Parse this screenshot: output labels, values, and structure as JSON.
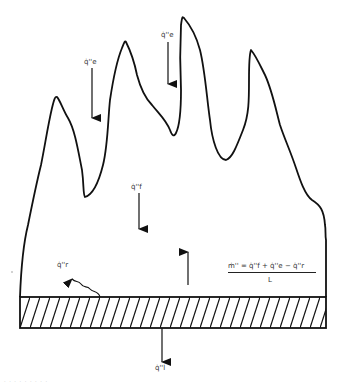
{
  "diagram": {
    "type": "flame heat flux schematic",
    "labels": {
      "external_flux_left": "q̇''e",
      "external_flux_top": "q̇''e",
      "flame_flux": "q̇''f",
      "reradiation_flux": "q̇''r",
      "loss_flux": "q̇''l"
    },
    "equation": {
      "numerator": "ṁ'' = q̇''f + q̇''e − q̇''r",
      "denominator": "L"
    },
    "caption": "· · · · · · · · ·",
    "colors": {
      "line": "#111111",
      "background": "#ffffff",
      "text": "#333333"
    }
  }
}
